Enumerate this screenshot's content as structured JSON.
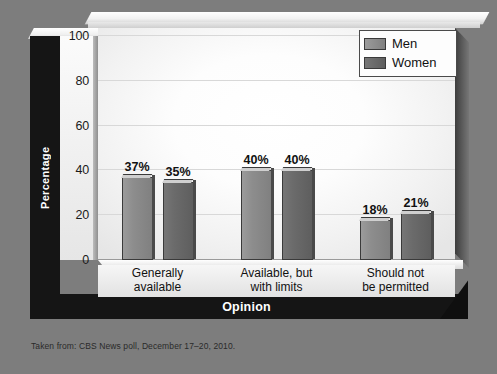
{
  "figure": {
    "caption": "Taken from: CBS News poll, December 17–20, 2010."
  },
  "legend": {
    "items": [
      {
        "label": "Men",
        "color": "#8d8d8d"
      },
      {
        "label": "Women",
        "color": "#6b6b6b"
      }
    ]
  },
  "axes": {
    "ylabel": "Percentage",
    "xlabel": "Opinion",
    "yticks": [
      "100",
      "80",
      "60",
      "40",
      "20",
      "0"
    ]
  },
  "chart_data": {
    "type": "bar",
    "title": "",
    "xlabel": "Opinion",
    "ylabel": "Percentage",
    "ylim": [
      0,
      100
    ],
    "yticks": [
      0,
      20,
      40,
      60,
      80,
      100
    ],
    "grid": true,
    "legend_position": "top-right",
    "categories": [
      "Generally available",
      "Available, but with limits",
      "Should not be permitted"
    ],
    "category_lines": [
      [
        "Generally",
        "available"
      ],
      [
        "Available, but",
        "with limits"
      ],
      [
        "Should not",
        "be permitted"
      ]
    ],
    "series": [
      {
        "name": "Men",
        "color": "#8d8d8d",
        "values": [
          37,
          40,
          18
        ],
        "labels": [
          "37%",
          "40%",
          "18%"
        ]
      },
      {
        "name": "Women",
        "color": "#6b6b6b",
        "values": [
          35,
          40,
          21
        ],
        "labels": [
          "35%",
          "40%",
          "21%"
        ]
      }
    ],
    "source": "CBS News poll, December 17–20, 2010"
  }
}
